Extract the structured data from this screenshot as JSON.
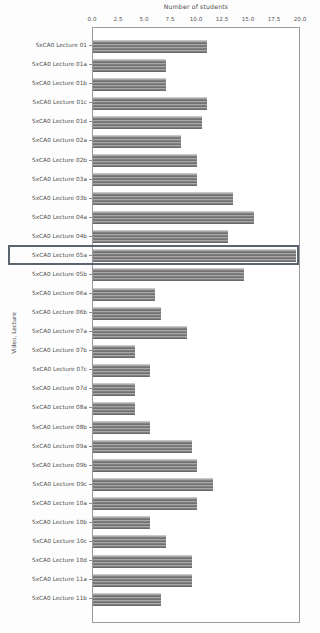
{
  "chart_data": {
    "type": "bar",
    "orientation": "horizontal",
    "title": "Number of students",
    "xlabel": "Number of students",
    "ylabel": "Video, Lecture",
    "xlim": [
      0,
      20
    ],
    "xticks": [
      "0.0",
      "2.5",
      "5.0",
      "7.5",
      "10.0",
      "12.5",
      "15.0",
      "17.5",
      "20.0"
    ],
    "xtick_values": [
      0,
      2.5,
      5,
      7.5,
      10,
      12.5,
      15,
      17.5,
      20
    ],
    "grid": false,
    "legend": "none",
    "categories": [
      "SxCA0 Lecture 01",
      "SxCA0 Lecture 01a",
      "SxCA0 Lecture 01b",
      "SxCA0 Lecture 01c",
      "SxCA0 Lecture 01d",
      "SxCA0 Lecture 02a",
      "SxCA0 Lecture 02b",
      "SxCA0 Lecture 03a",
      "SxCA0 Lecture 03b",
      "SxCA0 Lecture 04a",
      "SxCA0 Lecture 04b",
      "SxCA0 Lecture 05a",
      "SxCA0 Lecture 05b",
      "SxCA0 Lecture 06a",
      "SxCA0 Lecture 06b",
      "SxCA0 Lecture 07a",
      "SxCA0 Lecture 07b",
      "SxCA0 Lecture 07c",
      "SxCA0 Lecture 07d",
      "SxCA0 Lecture 08a",
      "SxCA0 Lecture 08b",
      "SxCA0 Lecture 09a",
      "SxCA0 Lecture 09b",
      "SxCA0 Lecture 09c",
      "SxCA0 Lecture 10a",
      "SxCA0 Lecture 10b",
      "SxCA0 Lecture 10c",
      "SxCA0 Lecture 10d",
      "SxCA0 Lecture 11a",
      "SxCA0 Lecture 11b"
    ],
    "values": [
      11,
      7,
      7,
      11,
      10.5,
      8.5,
      10,
      10,
      13.5,
      15.5,
      13,
      19.5,
      14.5,
      6,
      6.5,
      9,
      4,
      5.5,
      4,
      4,
      5.5,
      9.5,
      10,
      11.5,
      10,
      5.5,
      7,
      9.5,
      9.5,
      6.5
    ],
    "highlighted_category": "SxCA0 Lecture 05a",
    "highlighted_index": 11,
    "bar_color": "#7e7e7e",
    "highlight_color": "#5a6570"
  }
}
